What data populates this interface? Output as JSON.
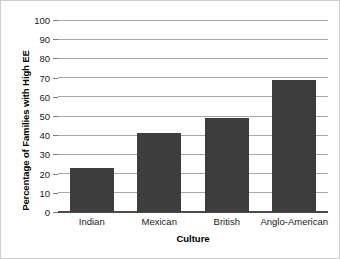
{
  "chart_data": {
    "type": "bar",
    "title": "",
    "xlabel": "Culture",
    "ylabel": "Percentage of Families with High EE",
    "categories": [
      "Indian",
      "Mexican",
      "British",
      "Anglo-American"
    ],
    "values": [
      23,
      41,
      49,
      69
    ],
    "ylim": [
      0,
      100
    ],
    "ytick_labels": [
      "0",
      "10",
      "20",
      "30",
      "40",
      "50",
      "60",
      "70",
      "80",
      "90",
      "100"
    ],
    "ytick_values": [
      0,
      10,
      20,
      30,
      40,
      50,
      60,
      70,
      80,
      90,
      100
    ],
    "grid": true,
    "legend": false,
    "legend_position": "none",
    "series": [
      {
        "name": "Percentage of Families with High EE",
        "values": [
          23,
          41,
          49,
          69
        ]
      }
    ],
    "colors": {
      "bar_fill": "#3d3d3d",
      "gridline": "#a8a8a8",
      "baseline": "#4a4a4a",
      "text": "#1a1a1a",
      "background": "#ffffff",
      "border": "#cfcfcf"
    }
  }
}
